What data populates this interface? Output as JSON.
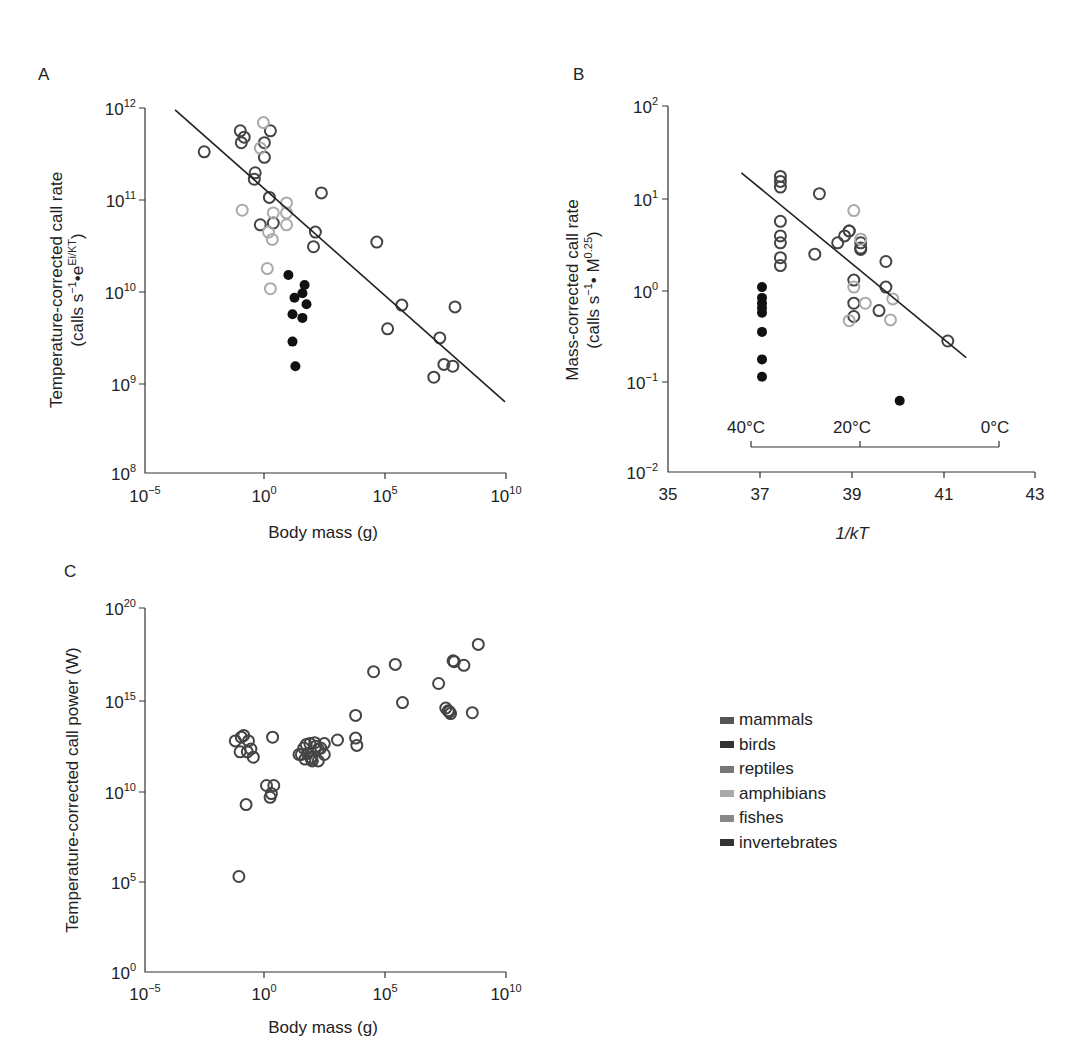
{
  "figure": {
    "panels": [
      "A",
      "B",
      "C"
    ]
  },
  "legend": {
    "items": [
      {
        "label": "mammals",
        "color": "#555555"
      },
      {
        "label": "birds",
        "color": "#333333"
      },
      {
        "label": "reptiles",
        "color": "#777777"
      },
      {
        "label": "amphibians",
        "color": "#aaaaaa"
      },
      {
        "label": "fishes",
        "color": "#888888"
      },
      {
        "label": "invertebrates",
        "color": "#333333"
      }
    ]
  },
  "chart_data": [
    {
      "panel": "A",
      "type": "scatter",
      "title": "",
      "xlabel": "Body mass (g)",
      "ylabel": "Temperature-corrected call rate (calls s^-1 • e^(Ei/KT))",
      "ylabel_line1": "Temperature-corrected call rate",
      "ylabel_line2_main": "(calls s",
      "ylabel_line2_sup1": "−1",
      "ylabel_line2_mid": "•e",
      "ylabel_line2_sup2": "Ei/KT",
      "ylabel_line2_end": ")",
      "x_scale": "log",
      "y_scale": "log",
      "xlim": [
        1e-05,
        10000000000.0
      ],
      "ylim": [
        100000000.0,
        1000000000000.0
      ],
      "x_ticks": [
        {
          "base": "10",
          "exp": "−5"
        },
        {
          "base": "10",
          "exp": "0"
        },
        {
          "base": "10",
          "exp": "5"
        },
        {
          "base": "10",
          "exp": "10"
        }
      ],
      "y_ticks": [
        {
          "base": "10",
          "exp": "12"
        },
        {
          "base": "10",
          "exp": "11"
        },
        {
          "base": "10",
          "exp": "10"
        },
        {
          "base": "10",
          "exp": "9"
        },
        {
          "base": "10",
          "exp": "8"
        }
      ],
      "grid": false,
      "fit_line_log10": {
        "x": [
          -3.75,
          9.96
        ],
        "y": [
          11.98,
          8.78
        ]
      },
      "series": [
        {
          "name": "vertebrates (dark open)",
          "marker": "open",
          "color": "#444444",
          "log10_x": [
            -2.54,
            -1.04,
            -0.88,
            -1.0,
            0.21,
            -0.04,
            -0.04,
            -0.42,
            -0.46,
            0.17,
            -0.21,
            0.33,
            2.33,
            2.08,
            2.0,
            4.63,
            5.67,
            5.08,
            7.25,
            7.88,
            7.42,
            7.79,
            7.0
          ],
          "log10_y": [
            11.52,
            11.75,
            11.68,
            11.62,
            11.75,
            11.62,
            11.46,
            11.29,
            11.22,
            11.02,
            10.72,
            10.74,
            11.07,
            10.64,
            10.48,
            10.53,
            9.84,
            9.58,
            9.48,
            9.82,
            9.19,
            9.17,
            9.05
          ]
        },
        {
          "name": "amphibians (light open)",
          "marker": "open",
          "color": "#aaaaaa",
          "log10_x": [
            -0.08,
            -0.21,
            -0.96,
            0.88,
            0.33,
            0.88,
            0.88,
            0.13,
            0.29,
            0.08,
            0.21
          ],
          "log10_y": [
            11.84,
            11.56,
            10.88,
            10.96,
            10.85,
            10.85,
            10.72,
            10.64,
            10.56,
            10.24,
            10.02
          ]
        },
        {
          "name": "invertebrates (filled)",
          "marker": "filled",
          "color": "#111111",
          "log10_x": [
            0.96,
            1.21,
            1.63,
            1.54,
            1.71,
            1.13,
            1.54,
            1.13,
            1.25
          ],
          "log10_y": [
            10.17,
            9.92,
            10.06,
            9.97,
            9.85,
            9.74,
            9.7,
            9.44,
            9.17
          ]
        }
      ]
    },
    {
      "panel": "B",
      "type": "scatter",
      "title": "",
      "xlabel": "1/kT",
      "ylabel": "Mass-corrected call rate (calls s^-1 • M^0.25)",
      "ylabel_line1": "Mass-corrected call rate",
      "ylabel_line2_main": "(calls s",
      "ylabel_line2_sup1": "−1",
      "ylabel_line2_mid": "• M",
      "ylabel_line2_sup2": "0.25",
      "ylabel_line2_end": ")",
      "x_scale": "linear",
      "y_scale": "log",
      "xlim": [
        35,
        43
      ],
      "ylim": [
        0.01,
        100
      ],
      "x_ticks": [
        "35",
        "37",
        "39",
        "41",
        "43"
      ],
      "y_ticks": [
        {
          "base": "10",
          "exp": "2"
        },
        {
          "base": "10",
          "exp": "1"
        },
        {
          "base": "10",
          "exp": "0"
        },
        {
          "base": "10",
          "exp": "−1"
        },
        {
          "base": "10",
          "exp": "−2"
        }
      ],
      "grid": false,
      "temperature_scale": {
        "labels": [
          "40°C",
          "20°C",
          "0°C"
        ],
        "x_positions": [
          37.0,
          39.4,
          42.45
        ]
      },
      "fit_line_log10": {
        "x": [
          36.6,
          41.5
        ],
        "y_log10": [
          1.27,
          -0.75
        ]
      },
      "series": [
        {
          "name": "vertebrates (dark open)",
          "marker": "open",
          "color": "#444444",
          "x": [
            37.45,
            37.45,
            37.45,
            37.45,
            37.45,
            37.45,
            37.45,
            37.45,
            38.3,
            38.2,
            38.7,
            38.85,
            38.95,
            38.95,
            39.2,
            39.2,
            39.2,
            39.75,
            39.75,
            39.05,
            39.05,
            39.05,
            39.6,
            41.1
          ],
          "y": [
            17,
            15,
            13,
            5.5,
            3.8,
            3.2,
            2.2,
            1.8,
            11,
            2.4,
            3.2,
            3.8,
            4.3,
            4.3,
            3.2,
            2.8,
            2.7,
            2.0,
            1.05,
            1.25,
            0.7,
            0.5,
            0.58,
            0.27
          ]
        },
        {
          "name": "amphibians (light open)",
          "marker": "open",
          "color": "#aaaaaa",
          "x": [
            39.05,
            39.2,
            39.05,
            39.3,
            38.95,
            39.9,
            39.85
          ],
          "y": [
            7.2,
            3.5,
            1.05,
            0.7,
            0.45,
            0.78,
            0.46
          ]
        },
        {
          "name": "invertebrates (filled)",
          "marker": "filled",
          "color": "#111111",
          "x": [
            37.05,
            37.05,
            37.05,
            37.05,
            37.05,
            37.05,
            37.05,
            37.05,
            40.05
          ],
          "y": [
            1.05,
            0.8,
            0.7,
            0.62,
            0.55,
            0.34,
            0.17,
            0.11,
            0.06
          ]
        }
      ]
    },
    {
      "panel": "C",
      "type": "scatter",
      "title": "",
      "xlabel": "Body mass (g)",
      "ylabel": "Temperature-corrected call power (W)",
      "x_scale": "log",
      "y_scale": "log",
      "xlim": [
        1e-05,
        10000000000.0
      ],
      "ylim": [
        1,
        1e+20
      ],
      "x_ticks": [
        {
          "base": "10",
          "exp": "−5"
        },
        {
          "base": "10",
          "exp": "0"
        },
        {
          "base": "10",
          "exp": "5"
        },
        {
          "base": "10",
          "exp": "10"
        }
      ],
      "y_ticks": [
        {
          "base": "10",
          "exp": "20"
        },
        {
          "base": "10",
          "exp": "15"
        },
        {
          "base": "10",
          "exp": "10"
        },
        {
          "base": "10",
          "exp": "5"
        },
        {
          "base": "10",
          "exp": "0"
        }
      ],
      "grid": false,
      "series": [
        {
          "name": "all taxa (open)",
          "marker": "open",
          "color": "#444444",
          "log10_x": [
            -1.1,
            -0.8,
            -1.25,
            -1.0,
            -0.9,
            -0.7,
            -1.05,
            -0.6,
            -0.5,
            -0.75,
            0.3,
            0.05,
            0.35,
            0.2,
            0.25,
            1.4,
            1.75,
            1.9,
            1.6,
            1.85,
            2.05,
            2.3,
            2.45,
            1.65,
            1.95,
            2.2,
            2.45,
            1.7,
            2.1,
            1.9,
            2.2,
            1.5,
            3.75,
            3.75,
            3.0,
            3.8,
            5.4,
            4.5,
            5.7,
            7.5,
            7.2,
            7.65,
            7.8,
            7.85,
            8.25,
            8.85,
            7.6,
            7.7,
            8.6
          ],
          "log10_y": [
            5.25,
            9.2,
            12.7,
            12.9,
            13.0,
            12.7,
            12.1,
            12.25,
            11.8,
            12.1,
            12.9,
            10.25,
            10.25,
            9.6,
            9.8,
            11.95,
            12.0,
            11.8,
            12.3,
            12.55,
            12.6,
            12.3,
            12.55,
            11.7,
            11.6,
            11.6,
            11.95,
            12.5,
            12.4,
            11.7,
            12.25,
            11.95,
            14.1,
            12.85,
            12.75,
            12.45,
            16.9,
            16.5,
            14.8,
            14.5,
            15.85,
            14.3,
            17.1,
            17.05,
            16.85,
            18.0,
            14.35,
            14.2,
            14.25
          ]
        }
      ]
    }
  ]
}
